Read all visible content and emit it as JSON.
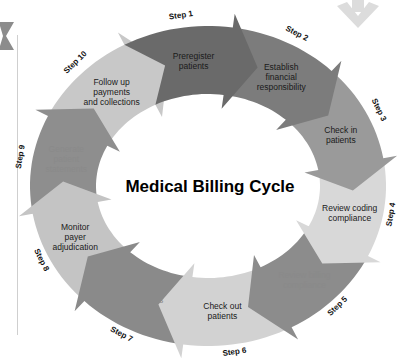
{
  "diagram": {
    "title": "Medical Billing Cycle",
    "type": "cycle",
    "steps": [
      {
        "step": "Step 1",
        "lines": [
          "Preregister",
          "patients"
        ],
        "color": "#6a6a6a"
      },
      {
        "step": "Step 2",
        "lines": [
          "Establish",
          "financial",
          "responsibility"
        ],
        "color": "#7c7c7c"
      },
      {
        "step": "Step 3",
        "lines": [
          "Check in",
          "patients"
        ],
        "color": "#9a9a9a"
      },
      {
        "step": "Step 4",
        "lines": [
          "Review coding",
          "compliance"
        ],
        "color": "#d8d8d8"
      },
      {
        "step": "Step 5",
        "lines": [
          "Review billing",
          "compliance"
        ],
        "color": "#8c8c8c"
      },
      {
        "step": "Step 6",
        "lines": [
          "Check out",
          "patients"
        ],
        "color": "#d2d2d2"
      },
      {
        "step": "Step 7",
        "lines": [
          "Prepare and",
          "transmit claims"
        ],
        "color": "#8a8a8a"
      },
      {
        "step": "Step 8",
        "lines": [
          "Monitor",
          "payer",
          "adjudication"
        ],
        "color": "#c4c4c4"
      },
      {
        "step": "Step 9",
        "lines": [
          "Generate",
          "patient",
          "statements"
        ],
        "color": "#8e8e8e"
      },
      {
        "step": "Step 10",
        "lines": [
          "Follow up",
          "payments",
          "and collections"
        ],
        "color": "#c8c8c8"
      }
    ]
  },
  "decor": {
    "left_chevron_color": "#8c8c8c",
    "down_arrow_color": "#dcdcdc"
  }
}
